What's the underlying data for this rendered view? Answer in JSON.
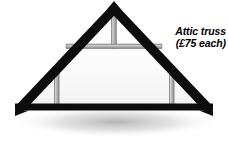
{
  "figure": {
    "type": "diagram",
    "background_color": "#ffffff",
    "timber_dark_color": "#0d0d0d",
    "timber_light_color": "#b3b3b3",
    "timber_light_edge_color": "#8c8c8c",
    "shadow_color": "#b8b8b8"
  },
  "annotation": {
    "line1": "Attic truss",
    "line2": "(£75 each)",
    "currency": "£",
    "price": "75",
    "unit": "each",
    "text_color": "#000000"
  },
  "geometry": {
    "apex": {
      "x": 114,
      "y": 4
    },
    "left_foot": {
      "x": 17,
      "y": 112
    },
    "right_foot": {
      "x": 211,
      "y": 112
    },
    "rafter_thickness": 9,
    "bottom_chord": {
      "x1": 16,
      "x2": 212,
      "y": 107,
      "thickness": 7
    },
    "king_post": {
      "x": 114,
      "y_top": 13,
      "y_bottom": 48,
      "width": 4
    },
    "collar_tie": {
      "x1": 67,
      "x2": 161,
      "y": 45,
      "thickness": 4
    },
    "left_post": {
      "x": 56,
      "y_top": 70,
      "y_bottom": 107,
      "width": 4
    },
    "right_post": {
      "x": 172,
      "y_top": 70,
      "y_bottom": 107,
      "width": 4
    }
  }
}
